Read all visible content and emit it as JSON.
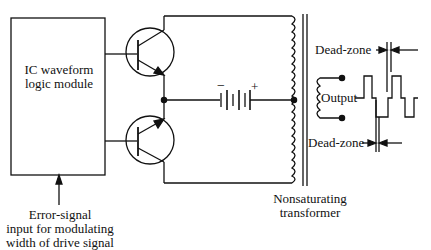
{
  "diagram": {
    "ic_module": {
      "label_line1": "IC waveform",
      "label_line2": "logic module"
    },
    "error_input": {
      "line1": "Error-signal",
      "line2": "input for modulating",
      "line3": "width of drive signal"
    },
    "battery": {
      "minus": "−",
      "plus": "+"
    },
    "transformer": {
      "line1": "Nonsaturating",
      "line2": "transformer"
    },
    "output_label": "Output",
    "dead_zone_top": "Dead-zone",
    "dead_zone_bottom": "Dead-zone",
    "components": [
      "IC waveform logic module",
      "NPN transistor (upper)",
      "NPN transistor (lower)",
      "DC battery",
      "Center-tapped primary winding",
      "Secondary winding",
      "Output terminals",
      "Output square waveform with dead-zones"
    ]
  }
}
